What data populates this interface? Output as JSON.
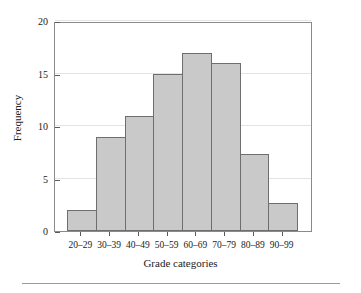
{
  "chart_data": {
    "type": "bar",
    "title": "",
    "subtitle": "",
    "xlabel": "Grade categories",
    "ylabel": "Frequency",
    "categories": [
      "20–29",
      "30–39",
      "40–49",
      "50–59",
      "60–69",
      "70–79",
      "80–89",
      "90–99"
    ],
    "values": [
      2,
      9,
      11,
      15,
      17,
      16,
      7.3,
      2.7
    ],
    "ylim": [
      0,
      20
    ],
    "yticks": [
      0,
      5,
      10,
      15,
      20
    ],
    "ytick_labels": [
      "0",
      "5",
      "10",
      "15",
      "20"
    ],
    "grid": true,
    "grid_axis": "y",
    "legend": false,
    "legend_position": "none",
    "bar_fill": "#c9c9c9",
    "bar_edge": "#6e6e6e",
    "axis_color": "#8a8a8a",
    "grid_color": "#e4e4e4"
  }
}
